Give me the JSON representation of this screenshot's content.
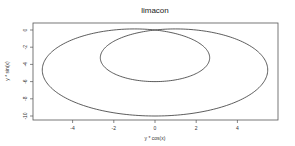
{
  "chart_data": {
    "type": "line",
    "title": "limacon",
    "xlabel": "y * cos(x)",
    "ylabel": "y * sin(x)",
    "xlim": [
      -5.6,
      6.0
    ],
    "ylim": [
      -10.5,
      0.8
    ],
    "xticks": [
      -4,
      -2,
      0,
      2,
      4
    ],
    "xtick_labels": [
      "-4",
      "-2",
      "0",
      "2",
      "4"
    ],
    "yticks": [
      0,
      -2,
      -4,
      -6,
      -8,
      -10
    ],
    "ytick_labels": [
      "0",
      "-2",
      "-4",
      "-6",
      "-8",
      "-10"
    ],
    "grid": false,
    "legend": null,
    "series": [
      {
        "name": "limacon",
        "equation": "r = 2 - 8*sin(theta); x = r*cos(theta), y = r*sin(theta)",
        "a": 2,
        "b": 8,
        "color": "#333333",
        "notes": "outer loop spans x ~ -5.5..5.5, y 0..-10; inner loop spans x ~ -2.6..2.6, y 0..-6"
      }
    ]
  },
  "colors": {
    "line": "#333333",
    "axes": "#555555",
    "background": "#ffffff"
  }
}
